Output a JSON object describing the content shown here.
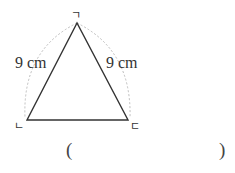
{
  "figure": {
    "shape": "isosceles triangle",
    "vertices": {
      "top": {
        "label": "ㄱ",
        "x": 77,
        "y": 23
      },
      "bottom_left": {
        "label": "ㄴ",
        "x": 27,
        "y": 120
      },
      "bottom_right": {
        "label": "ㄷ",
        "x": 128,
        "y": 120
      }
    },
    "side_labels": {
      "left": "9 cm",
      "right": "9 cm"
    },
    "colors": {
      "stroke": "#333333",
      "arc": "#bbbbbb",
      "text": "#333333"
    }
  },
  "answer": {
    "open_paren": "(",
    "close_paren": ")",
    "value": ""
  }
}
